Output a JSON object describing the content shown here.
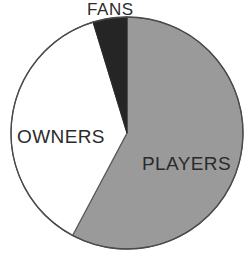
{
  "chart_data": {
    "type": "pie",
    "title": "",
    "subtitle": "",
    "xlabel": "",
    "ylabel": "",
    "legend_position": "none",
    "grid": false,
    "labels_inline": true,
    "categories": [
      "PLAYERS",
      "OWNERS",
      "FANS"
    ],
    "values": [
      58,
      37,
      5
    ],
    "unit": "percent",
    "slices": [
      {
        "name": "PLAYERS",
        "label": "PLAYERS",
        "value": 58,
        "start_angle_deg": 0,
        "end_angle_deg": 208,
        "sweep_deg": 208,
        "color": "#9a9a9a"
      },
      {
        "name": "OWNERS",
        "label": "OWNERS",
        "value": 37,
        "start_angle_deg": 208,
        "end_angle_deg": 343,
        "sweep_deg": 135,
        "color": "#ffffff"
      },
      {
        "name": "FANS",
        "label": "FANS",
        "value": 5,
        "start_angle_deg": 343,
        "end_angle_deg": 360,
        "sweep_deg": 17,
        "color": "#252525"
      }
    ]
  },
  "figure": {
    "background_color": "#ffffff",
    "outline_color": "#4a4a4a",
    "text_color": "#2b2b2b",
    "center_x": 127,
    "center_y": 133,
    "radius": 116
  },
  "labels": {
    "fans": "FANS",
    "owners": "OWNERS",
    "players": "PLAYERS"
  }
}
